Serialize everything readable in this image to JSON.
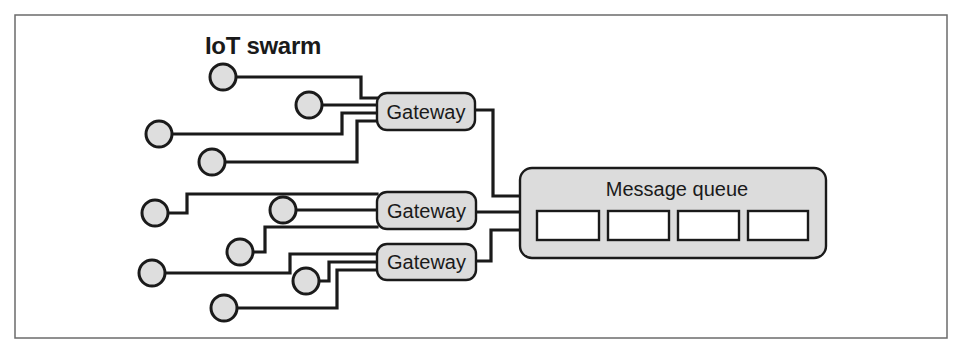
{
  "diagram": {
    "title": "IoT swarm",
    "frame": {
      "x": 15,
      "y": 15,
      "w": 932,
      "h": 323
    },
    "colors": {
      "node_fill": "#dedede",
      "box_fill": "#dcdcdc",
      "stroke": "#1a1a1a",
      "slot_fill": "#ffffff"
    },
    "devices": [
      {
        "id": "device-1",
        "cx": 223,
        "cy": 77
      },
      {
        "id": "device-2",
        "cx": 309,
        "cy": 105
      },
      {
        "id": "device-3",
        "cx": 159,
        "cy": 134
      },
      {
        "id": "device-4",
        "cx": 212,
        "cy": 162
      },
      {
        "id": "device-5",
        "cx": 155,
        "cy": 213
      },
      {
        "id": "device-6",
        "cx": 283,
        "cy": 210
      },
      {
        "id": "device-7",
        "cx": 240,
        "cy": 252
      },
      {
        "id": "device-8",
        "cx": 152,
        "cy": 273
      },
      {
        "id": "device-9",
        "cx": 306,
        "cy": 281
      },
      {
        "id": "device-10",
        "cx": 224,
        "cy": 308
      }
    ],
    "device_radius": 13,
    "gateways": [
      {
        "id": "gateway-1",
        "label": "Gateway",
        "x": 377,
        "y": 93,
        "w": 98,
        "h": 37
      },
      {
        "id": "gateway-2",
        "label": "Gateway",
        "x": 377,
        "y": 192,
        "w": 99,
        "h": 37
      },
      {
        "id": "gateway-3",
        "label": "Gateway",
        "x": 377,
        "y": 244,
        "w": 99,
        "h": 36
      }
    ],
    "message_queue": {
      "label": "Message queue",
      "x": 520,
      "y": 168,
      "w": 306,
      "h": 90,
      "slots": [
        {
          "x": 537,
          "y": 211,
          "w": 62,
          "h": 29
        },
        {
          "x": 608,
          "y": 211,
          "w": 61,
          "h": 29
        },
        {
          "x": 678,
          "y": 211,
          "w": 61,
          "h": 29
        },
        {
          "x": 748,
          "y": 211,
          "w": 60,
          "h": 29
        }
      ]
    },
    "connections": [
      {
        "from": "device-1",
        "to": "gateway-1",
        "points": "236,77 361,77 361,98 377,98"
      },
      {
        "from": "device-2",
        "to": "gateway-1",
        "points": "322,105 377,105"
      },
      {
        "from": "device-3",
        "to": "gateway-1",
        "points": "172,134 342,134 342,113 377,113"
      },
      {
        "from": "device-4",
        "to": "gateway-1",
        "points": "225,162 357,162 357,121 377,121"
      },
      {
        "from": "device-5",
        "to": "gateway-2",
        "points": "168,213 187,213 187,194 377,194"
      },
      {
        "from": "device-6",
        "to": "gateway-2",
        "points": "296,210 377,210"
      },
      {
        "from": "device-7",
        "to": "gateway-2",
        "points": "253,252 265,252 265,227 377,227"
      },
      {
        "from": "device-8",
        "to": "gateway-3",
        "points": "165,273 290,273 290,254 377,254"
      },
      {
        "from": "device-9",
        "to": "gateway-3",
        "points": "319,281 329,281 329,262 377,262"
      },
      {
        "from": "device-10",
        "to": "gateway-3",
        "points": "237,308 337,308 337,270 377,270"
      },
      {
        "from": "gateway-1",
        "to": "message-queue",
        "points": "475,110 493,110 493,196 520,196"
      },
      {
        "from": "gateway-2",
        "to": "message-queue",
        "points": "476,212 520,212"
      },
      {
        "from": "gateway-3",
        "to": "message-queue",
        "points": "476,261 491,261 491,230 520,230"
      }
    ]
  }
}
